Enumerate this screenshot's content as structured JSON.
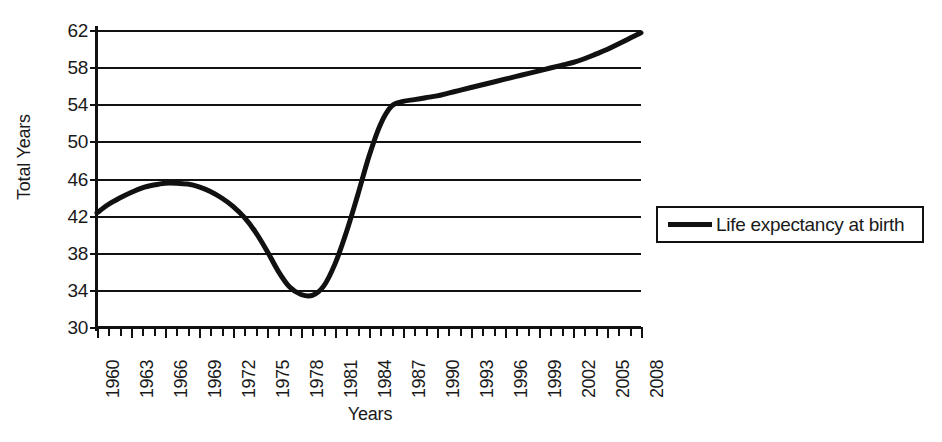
{
  "chart_data": {
    "type": "line",
    "title": "",
    "xlabel": "Years",
    "ylabel": "Total Years",
    "ylim": [
      30,
      62
    ],
    "yticks": [
      30,
      34,
      38,
      42,
      46,
      50,
      54,
      58,
      62
    ],
    "grid": true,
    "legend_position": "right",
    "legend": [
      "Life expectancy at birth"
    ],
    "x": [
      1960,
      1961,
      1962,
      1963,
      1964,
      1965,
      1966,
      1967,
      1968,
      1969,
      1970,
      1971,
      1972,
      1973,
      1974,
      1975,
      1976,
      1977,
      1978,
      1979,
      1980,
      1981,
      1982,
      1983,
      1984,
      1985,
      1986,
      1987,
      1988,
      1989,
      1990,
      1991,
      1992,
      1993,
      1994,
      1995,
      1996,
      1997,
      1998,
      1999,
      2000,
      2001,
      2002,
      2003,
      2004,
      2005,
      2006,
      2007,
      2008
    ],
    "xtick_labels": [
      "1960",
      "1963",
      "1966",
      "1969",
      "1972",
      "1975",
      "1978",
      "1981",
      "1984",
      "1987",
      "1990",
      "1993",
      "1996",
      "1999",
      "2002",
      "2005",
      "2008"
    ],
    "xtick_values": [
      1960,
      1963,
      1966,
      1969,
      1972,
      1975,
      1978,
      1981,
      1984,
      1987,
      1990,
      1993,
      1996,
      1999,
      2002,
      2005,
      2008
    ],
    "series": [
      {
        "name": "Life expectancy at birth",
        "color": "#111111",
        "values": [
          42.3,
          43.2,
          43.9,
          44.5,
          45.0,
          45.3,
          45.5,
          45.5,
          45.4,
          45.1,
          44.6,
          43.9,
          43.0,
          41.8,
          40.2,
          38.2,
          36.0,
          34.3,
          33.5,
          33.4,
          34.4,
          36.8,
          40.2,
          44.2,
          48.4,
          51.8,
          53.8,
          54.3,
          54.5,
          54.7,
          54.9,
          55.2,
          55.5,
          55.8,
          56.1,
          56.4,
          56.7,
          57.0,
          57.3,
          57.6,
          57.9,
          58.2,
          58.5,
          58.9,
          59.4,
          59.9,
          60.5,
          61.1,
          61.7
        ]
      }
    ]
  },
  "axis": {
    "y_title": "Total Years",
    "x_title": "Years"
  },
  "legend_box": {
    "label": "Life expectancy at birth",
    "line_color": "#111111"
  }
}
